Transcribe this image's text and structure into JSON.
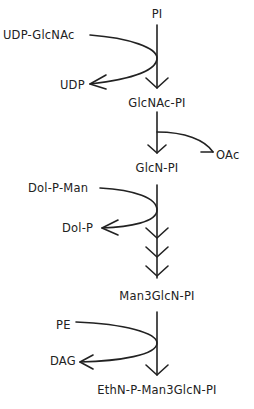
{
  "diagram": {
    "type": "biosynthetic pathway",
    "main_chain": [
      {
        "id": "pi",
        "label": "PI"
      },
      {
        "id": "glcnac-pi",
        "label": "GlcNAc-PI"
      },
      {
        "id": "glcn-pi",
        "label": "GlcN-PI"
      },
      {
        "id": "man3glcn-pi",
        "label": "Man3GlcN-PI"
      },
      {
        "id": "ethn-p-man3glcn-pi",
        "label": "EthN-P-Man3GlcN-PI"
      }
    ],
    "side_reactions": [
      {
        "step": 1,
        "input": "UDP-GlcNAc",
        "output": "UDP"
      },
      {
        "step": 2,
        "input": "",
        "output": "OAc"
      },
      {
        "step": 3,
        "input": "Dol-P-Man",
        "output": "Dol-P",
        "arrows": 3
      },
      {
        "step": 4,
        "input": "PE",
        "output": "DAG"
      }
    ],
    "stroke_color": "#222222"
  }
}
